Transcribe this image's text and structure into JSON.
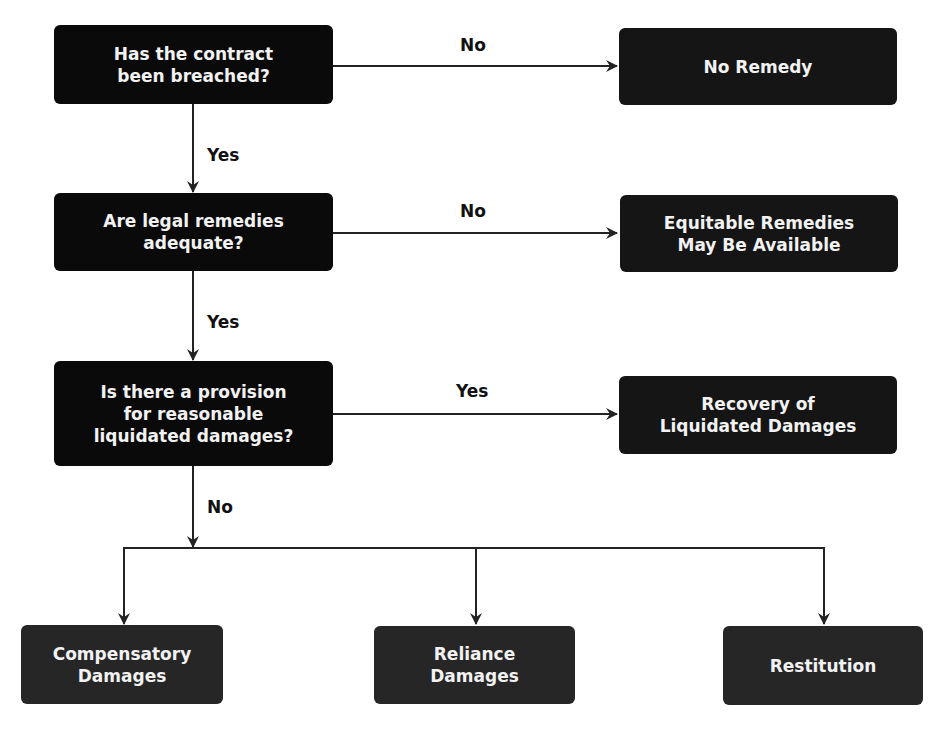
{
  "flowchart": {
    "questions": [
      {
        "label": "Has the contract\nbeen breached?"
      },
      {
        "label": "Are legal remedies\nadequate?"
      },
      {
        "label": "Is there a provision\nfor reasonable\nliquidated damages?"
      }
    ],
    "results": [
      {
        "label": "No Remedy"
      },
      {
        "label": "Equitable Remedies\nMay Be Available"
      },
      {
        "label": "Recovery of\nLiquidated Damages"
      }
    ],
    "outcomes": [
      {
        "label": "Compensatory\nDamages"
      },
      {
        "label": "Reliance\nDamages"
      },
      {
        "label": "Restitution"
      }
    ],
    "edge_labels": {
      "q1_right": "No",
      "q1_down": "Yes",
      "q2_right": "No",
      "q2_down": "Yes",
      "q3_right": "Yes",
      "q3_down": "No"
    },
    "colors": {
      "box": "#0a0a0a",
      "outcome_box": "#262626",
      "line": "#222222",
      "text": "#f2f2f2"
    }
  }
}
